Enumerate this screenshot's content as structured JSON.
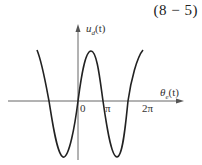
{
  "equation_number": "(8 − 5)",
  "axes": {
    "y_label": {
      "base": "u",
      "sub": "d",
      "arg": "(t)"
    },
    "x_label": {
      "base": "θ",
      "sub": "e",
      "arg": "(t)"
    },
    "ticks": [
      "0",
      "π",
      "2π"
    ]
  },
  "curve": {
    "description": "sinusoid crossing zero at origin, peak between 0 and π, minima left of 0 and right of π",
    "stroke": "#222222"
  },
  "colors": {
    "axis": "#555555",
    "curve": "#222222"
  }
}
